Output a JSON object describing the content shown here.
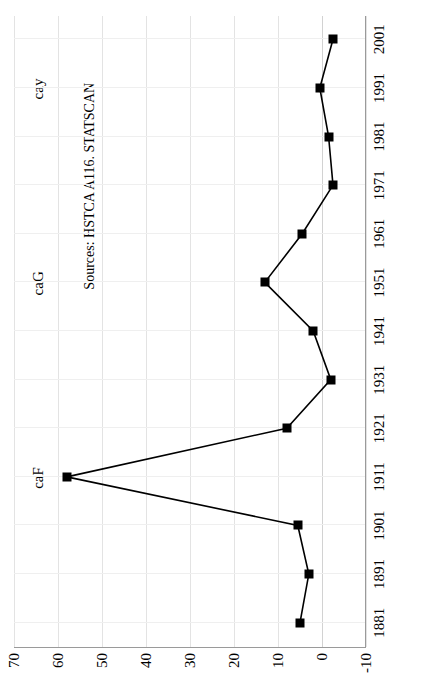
{
  "chart_data": {
    "type": "line",
    "title": "",
    "subtitle": "",
    "xlabel": "",
    "ylabel": "",
    "orientation": "rotated-90-ccw",
    "grid": true,
    "legend": "none",
    "xlim": [
      1876,
      2006
    ],
    "ylim": [
      -10,
      70
    ],
    "ytick_step": 10,
    "x": [
      1881,
      1891,
      1901,
      1911,
      1921,
      1931,
      1941,
      1951,
      1961,
      1971,
      1981,
      1991,
      2001
    ],
    "xtick_labels": [
      "1881",
      "1891",
      "1901",
      "1911",
      "1921",
      "1931",
      "1941",
      "1951",
      "1961",
      "1971",
      "1981",
      "1991",
      "2001"
    ],
    "ytick_labels": [
      "70",
      "60",
      "50",
      "40",
      "30",
      "20",
      "10",
      "0",
      "-10"
    ],
    "ytick_values": [
      70,
      60,
      50,
      40,
      30,
      20,
      10,
      0,
      -10
    ],
    "series": [
      {
        "name": "series-1",
        "marker": "square",
        "color": "#000000",
        "values": [
          5.0,
          3.0,
          5.5,
          58.0,
          8.0,
          -2.0,
          2.0,
          13.0,
          4.5,
          -2.5,
          -1.5,
          0.5,
          -2.5
        ]
      }
    ],
    "annotations": [
      {
        "id": "caF",
        "text": "caF",
        "x": 1911
      },
      {
        "id": "caG",
        "text": "caG",
        "x": 1951
      },
      {
        "id": "cay",
        "text": "cay",
        "x": 1991
      },
      {
        "id": "source",
        "text": "Sources: HSTCA A116. STATSCAN"
      }
    ]
  },
  "labels": {
    "caF": "caF",
    "caG": "caG",
    "cay": "cay",
    "source": "Sources: HSTCA A116. STATSCAN"
  }
}
